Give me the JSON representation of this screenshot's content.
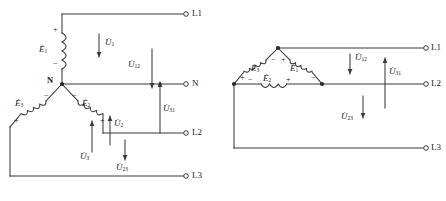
{
  "figure": {
    "line_color": "#3a3a3a",
    "text_color": "#1a1a1a"
  },
  "star_diagram": {
    "name": "star-connection",
    "neutral_label": "N",
    "terminals": [
      {
        "id": "L1",
        "label": "L1"
      },
      {
        "id": "N",
        "label": "N"
      },
      {
        "id": "L2",
        "label": "L2"
      },
      {
        "id": "L3",
        "label": "L3"
      }
    ],
    "emf_sources": [
      {
        "id": "E1",
        "symbol": "E",
        "subscript": "1",
        "plus": "+",
        "minus": "−"
      },
      {
        "id": "E2",
        "symbol": "E",
        "subscript": "2",
        "plus": "+",
        "minus": "−"
      },
      {
        "id": "E3",
        "symbol": "E",
        "subscript": "3",
        "plus": "+",
        "minus": "−"
      }
    ],
    "voltages": [
      {
        "id": "U1",
        "symbol": "U",
        "subscript": "1",
        "direction": "down"
      },
      {
        "id": "U12",
        "symbol": "U",
        "subscript": "12",
        "direction": "down"
      },
      {
        "id": "U31",
        "symbol": "U",
        "subscript": "31",
        "direction": "up"
      },
      {
        "id": "U2",
        "symbol": "U",
        "subscript": "2",
        "direction": "up"
      },
      {
        "id": "U3",
        "symbol": "U",
        "subscript": "3",
        "direction": "up"
      },
      {
        "id": "U23",
        "symbol": "U",
        "subscript": "23",
        "direction": "down"
      }
    ]
  },
  "delta_diagram": {
    "name": "delta-connection",
    "terminals": [
      {
        "id": "L1",
        "label": "L1"
      },
      {
        "id": "L2",
        "label": "L2"
      },
      {
        "id": "L3",
        "label": "L3"
      }
    ],
    "emf_sources": [
      {
        "id": "E1",
        "symbol": "E",
        "subscript": "1",
        "plus": "+",
        "minus": "−"
      },
      {
        "id": "E2",
        "symbol": "E",
        "subscript": "2",
        "plus": "+",
        "minus": "−"
      },
      {
        "id": "E3",
        "symbol": "E",
        "subscript": "3",
        "plus": "+",
        "minus": "−"
      }
    ],
    "voltages": [
      {
        "id": "U12",
        "symbol": "U",
        "subscript": "12",
        "direction": "down"
      },
      {
        "id": "U31",
        "symbol": "U",
        "subscript": "31",
        "direction": "up"
      },
      {
        "id": "U23",
        "symbol": "U",
        "subscript": "23",
        "direction": "down"
      }
    ]
  }
}
